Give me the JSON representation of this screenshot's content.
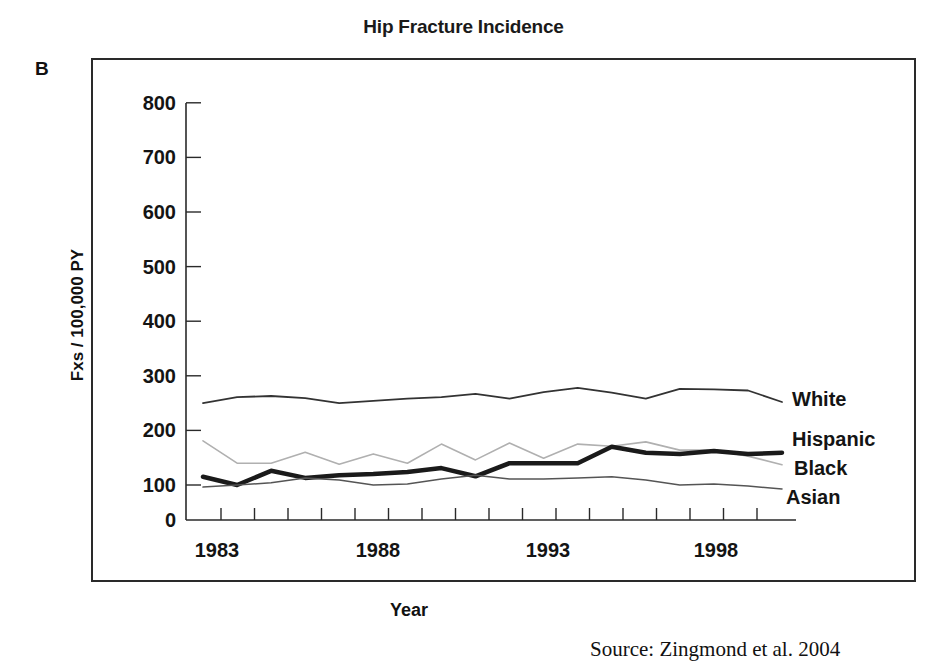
{
  "panel": {
    "letter": "B"
  },
  "source_text": "Source: Zingmond et al. 2004",
  "chart_data": {
    "type": "line",
    "title": "Hip Fracture Incidence",
    "xlabel": "Year",
    "ylabel": "Fxs / 100,000 PY",
    "ylim": [
      0,
      800
    ],
    "yticks": [
      0,
      100,
      200,
      300,
      400,
      500,
      600,
      700,
      800
    ],
    "xtick_labels": [
      "1983",
      "1988",
      "1993",
      "1998"
    ],
    "grid": false,
    "legend_position": "inline-right",
    "x": [
      1983,
      1984,
      1985,
      1986,
      1987,
      1988,
      1989,
      1990,
      1991,
      1992,
      1993,
      1994,
      1995,
      1996,
      1997,
      1998,
      1999,
      2000
    ],
    "series": [
      {
        "name": "White",
        "style": "thin-dark",
        "color": "#333333",
        "values": [
          250,
          261,
          263,
          259,
          250,
          254,
          258,
          261,
          267,
          258,
          270,
          278,
          269,
          258,
          276,
          275,
          273,
          252
        ]
      },
      {
        "name": "Hispanic",
        "style": "thin-light",
        "color": "#b0b0b0",
        "values": [
          181,
          140,
          140,
          160,
          138,
          157,
          140,
          175,
          146,
          177,
          149,
          175,
          171,
          179,
          164,
          164,
          153,
          137
        ]
      },
      {
        "name": "Black",
        "style": "thick-dark",
        "color": "#1a1a1a",
        "values": [
          115,
          100,
          126,
          113,
          118,
          120,
          124,
          131,
          116,
          140,
          140,
          140,
          170,
          159,
          157,
          162,
          157,
          159
        ]
      },
      {
        "name": "Asian",
        "style": "thin-mid",
        "color": "#555555",
        "values": [
          94,
          100,
          104,
          113,
          109,
          100,
          102,
          111,
          118,
          111,
          111,
          113,
          115,
          109,
          100,
          102,
          97,
          89
        ]
      }
    ]
  }
}
